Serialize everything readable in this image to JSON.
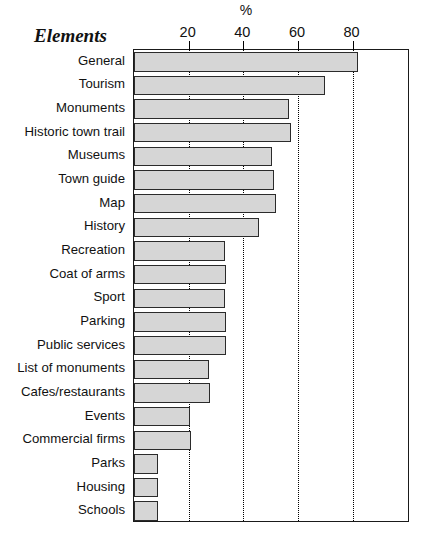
{
  "chart_data": {
    "type": "bar",
    "orientation": "horizontal",
    "title": "%",
    "xlabel": "%",
    "ylabel": "Elements",
    "xlim": [
      0,
      101
    ],
    "xticks": [
      20,
      40,
      60,
      80
    ],
    "xtick_labels": [
      "20",
      "40",
      "60",
      "80"
    ],
    "grid": "vertical dotted gridlines at xticks",
    "legend": "none",
    "bar_fill_color": "#d6d6d6",
    "bar_edge_color": "#2b2b2b",
    "categories": [
      "General",
      "Tourism",
      "Monuments",
      "Historic town trail",
      "Museums",
      "Town guide",
      "Map",
      "History",
      "Recreation",
      "Coat of arms",
      "Sport",
      "Parking",
      "Public services",
      "List of monuments",
      "Cafes/restaurants",
      "Events",
      "Commercial firms",
      "Parks",
      "Housing",
      "Schools"
    ],
    "values": [
      82,
      70,
      57,
      57.5,
      50.5,
      51.5,
      52,
      46,
      33.5,
      34,
      33.5,
      34,
      34,
      27.5,
      28,
      20.5,
      21,
      9,
      9,
      9
    ]
  }
}
